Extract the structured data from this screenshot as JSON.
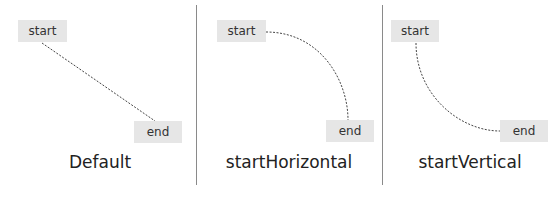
{
  "panels": [
    {
      "caption": "Default",
      "start_label": "start",
      "end_label": "end",
      "connector": "straight"
    },
    {
      "caption": "startHorizontal",
      "start_label": "start",
      "end_label": "end",
      "connector": "curve-horizontal-start"
    },
    {
      "caption": "startVertical",
      "start_label": "start",
      "end_label": "end",
      "connector": "curve-vertical-start"
    }
  ],
  "colors": {
    "node_fill": "#e6e6e6",
    "node_text": "#333333",
    "connector": "#444444",
    "divider": "#8a8a8a",
    "caption_text": "#222222"
  }
}
